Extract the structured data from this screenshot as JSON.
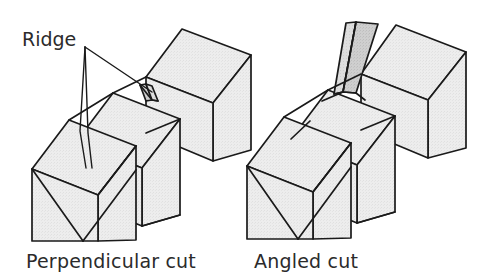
{
  "figure": {
    "background_color": "#ffffff",
    "line_color": "#1a1a1a",
    "face_fill": "#ececec",
    "face_fill_dark": "#c9c9c9",
    "face_fill_mid": "#dcdcdc"
  },
  "annotations": {
    "ridge_label": "Ridge",
    "ridge_label_x": 22,
    "ridge_label_y": 46,
    "leader_origin_x": 84,
    "leader_origin_y": 48
  },
  "panels": [
    {
      "id": "perpendicular",
      "caption": "Perpendicular cut",
      "caption_x": 26,
      "caption_y": 268,
      "ridge_type": "short-vertical-sliver",
      "has_ridge_callout": true
    },
    {
      "id": "angled",
      "caption": "Angled cut",
      "caption_x": 254,
      "caption_y": 268,
      "ridge_type": "tall-leaning-sliver",
      "has_ridge_callout": false
    }
  ]
}
